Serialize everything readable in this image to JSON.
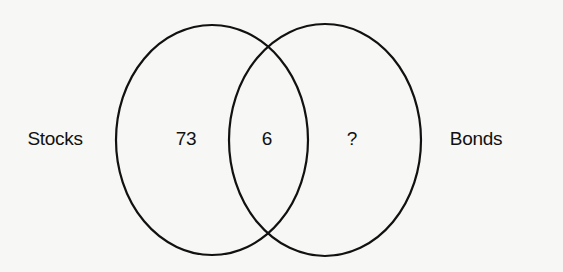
{
  "diagram": {
    "type": "venn",
    "sets": [
      {
        "name": "Stocks",
        "only_count": "73"
      },
      {
        "name": "Bonds",
        "only_count": "?"
      }
    ],
    "intersection_count": "6",
    "labels": {
      "left_set": "Stocks",
      "right_set": "Bonds",
      "left_only": "73",
      "intersection": "6",
      "right_only": "?"
    },
    "colors": {
      "stroke": "#111111",
      "background": "#f7f7f5"
    }
  }
}
